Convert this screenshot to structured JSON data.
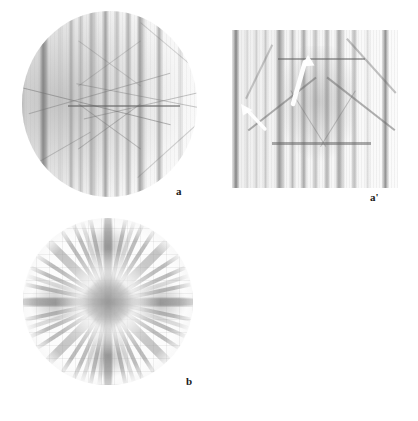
{
  "figure": {
    "kind": "scientific-figure",
    "description": "Three-panel electron diffraction (Kikuchi) pattern figure on white background",
    "background_color": "#ffffff",
    "width": 418,
    "height": 421
  },
  "panels": [
    {
      "id": "a",
      "label": "a",
      "shape": "circle",
      "label_x": 177,
      "label_y": 188,
      "x": 22,
      "y": 11,
      "width": 175,
      "height": 186,
      "content": "Circular Kikuchi diffraction pattern with strong vertical bands and faint oblique lines; left side darker.",
      "vertical_band_positions_pct": [
        2,
        13,
        22.6,
        28.6,
        33.8,
        39.6,
        47.4,
        53.8,
        60,
        66.4,
        77,
        88.6
      ],
      "band_intensities": [
        0.3,
        0.62,
        0.28,
        0.45,
        0.4,
        0.46,
        0.55,
        0.42,
        0.5,
        0.58,
        0.52,
        0.3
      ],
      "horizontal_line_y_pct": 50.5,
      "oblique_lines": [
        {
          "x_pct": 18,
          "y_pct": 50,
          "len_pct": 86,
          "angle_deg": 14
        },
        {
          "x_pct": 30,
          "y_pct": 45,
          "len_pct": 80,
          "angle_deg": -16
        },
        {
          "x_pct": 64,
          "y_pct": 48,
          "len_pct": 92,
          "angle_deg": 11
        },
        {
          "x_pct": 74,
          "y_pct": 50,
          "len_pct": 88,
          "angle_deg": -12
        },
        {
          "x_pct": 46,
          "y_pct": 62,
          "len_pct": 52,
          "angle_deg": 34
        },
        {
          "x_pct": 50,
          "y_pct": 62,
          "len_pct": 52,
          "angle_deg": -34
        },
        {
          "x_pct": 22,
          "y_pct": 74,
          "len_pct": 46,
          "angle_deg": -28
        },
        {
          "x_pct": 86,
          "y_pct": 22,
          "len_pct": 40,
          "angle_deg": 38
        }
      ]
    },
    {
      "id": "a-prime",
      "label": "a'",
      "shape": "rectangle",
      "label_x": 371,
      "label_y": 194,
      "x": 232,
      "y": 30,
      "width": 166,
      "height": 158,
      "content": "Rectangular contrast-enhanced enlargement of panel a, showing the same vertical Kikuchi bands; two white arrows mark features.",
      "vertical_band_positions_pct": [
        2.4,
        9,
        14.6,
        20.2,
        28.4,
        36.4,
        43.2,
        50.2,
        57.2,
        64.4,
        73.6,
        81.8,
        92.4
      ],
      "horizontal_lines_y_pct": [
        18,
        71
      ],
      "arrows": [
        {
          "name": "arrow-upper",
          "x1": 61,
          "y1": 72,
          "x2": 76,
          "y2": 27,
          "color": "#ffffff",
          "points": "up-right"
        },
        {
          "name": "arrow-lower",
          "x1": 32,
          "y1": 97,
          "x2": 10,
          "y2": 74,
          "color": "#ffffff",
          "points": "up-left"
        }
      ]
    },
    {
      "id": "b",
      "label": "b",
      "shape": "circle",
      "label_x": 187,
      "label_y": 378,
      "x": 23,
      "y": 218,
      "width": 170,
      "height": 167,
      "content": "Circular diffraction pattern with four-fold radial symmetry: many Kikuchi bands radiating from a dark square core at the centre, forming a star/rosette.",
      "symmetry": "4-fold",
      "ray_angles_deg": [
        0,
        12,
        24,
        36,
        45,
        54,
        66,
        78,
        90,
        102,
        114,
        126,
        135,
        144,
        156,
        168,
        180,
        192,
        204,
        216,
        225,
        234,
        246,
        258,
        270,
        282,
        294,
        306,
        315,
        324,
        336,
        348
      ],
      "wide_ray_angles_deg": [
        0,
        45,
        90,
        135,
        180,
        225,
        270,
        315
      ],
      "core": {
        "shape": "diamond",
        "size_px": 46,
        "darkness": 0.62
      }
    }
  ],
  "labels": {
    "a": "a",
    "a_prime": "a'",
    "b": "b"
  },
  "colors": {
    "background": "#ffffff",
    "label_text": "#1a1a1a",
    "band_dark": "#5a5a5a",
    "band_mid": "#8c8c8c",
    "band_light": "#c8c8c8",
    "arrow": "#ffffff"
  }
}
